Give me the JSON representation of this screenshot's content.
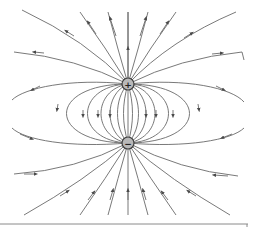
{
  "figure": {
    "positive_charge": {
      "label": "+",
      "x": 128,
      "y": 84,
      "r": 6
    },
    "negative_charge": {
      "label": "−",
      "x": 128,
      "y": 143,
      "r": 6
    },
    "line_color": "#6a6a6a",
    "charge_fill": "#b8b8b8",
    "field_direction": "from + to −"
  }
}
